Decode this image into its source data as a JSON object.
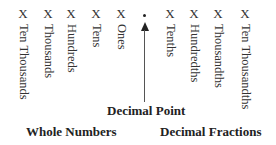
{
  "diagram": {
    "placeholder_symbol": "X",
    "whole_places": [
      "Ten Thousands",
      "Thousands",
      "Hundreds",
      "Tens",
      "Ones"
    ],
    "decimal_places": [
      "Tenths",
      "Hundredths",
      "Thousandths",
      "Ten Thousandths"
    ],
    "decimal_point_label": "Decimal Point",
    "whole_numbers_label": "Whole Numbers",
    "decimal_fractions_label": "Decimal Fractions"
  }
}
